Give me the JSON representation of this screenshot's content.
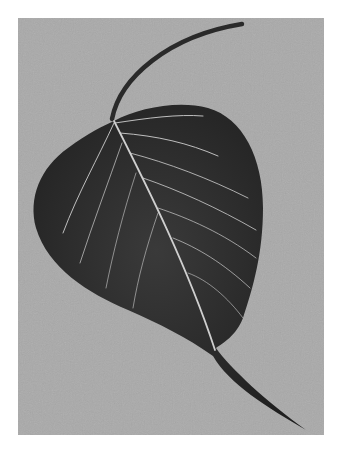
{
  "image": {
    "subject": "leaf",
    "description": "Black and white photograph of a heart-shaped leaf with long curved stem and drip tip on a gray textured background",
    "colors": {
      "background": "#a9a9a9",
      "leaf": "#2e2e2e",
      "veins": "#cfcfcf",
      "canvas": "#ffffff"
    }
  }
}
